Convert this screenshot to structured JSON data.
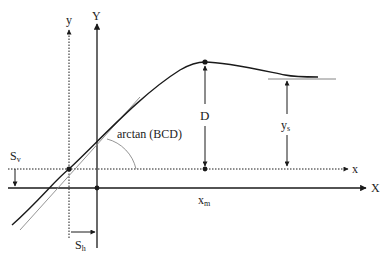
{
  "diagram": {
    "colors": {
      "stroke": "#1a1a1a",
      "tangent": "#888888",
      "background": "#ffffff"
    },
    "axes": {
      "shifted_x_label": "x",
      "shifted_y_label": "y",
      "main_x_label": "X",
      "main_y_label": "Y"
    },
    "labels": {
      "peak": "D",
      "slope": "arctan (BCD)",
      "asymptote_main": "y",
      "asymptote_sub": "s",
      "peak_x_main": "x",
      "peak_x_sub": "m",
      "vertical_shift_main": "S",
      "vertical_shift_sub": "v",
      "horizontal_shift_main": "S",
      "horizontal_shift_sub": "h"
    }
  }
}
